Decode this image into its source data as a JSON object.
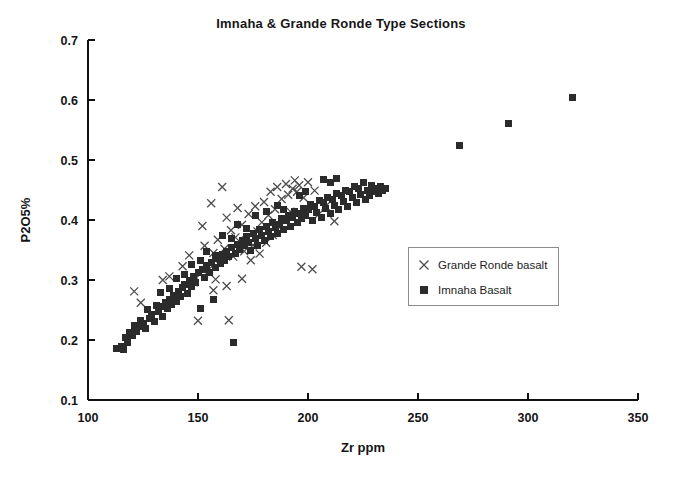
{
  "chart_data": {
    "type": "scatter",
    "title": "Imnaha & Grande Ronde Type Sections",
    "xlabel": "Zr ppm",
    "ylabel": "P2O5%",
    "xlim": [
      100,
      350
    ],
    "ylim": [
      0.1,
      0.7
    ],
    "xticks": [
      100,
      150,
      200,
      250,
      300,
      350
    ],
    "xtick_labels": [
      "100",
      "150",
      "200",
      "250",
      "300",
      "350"
    ],
    "yticks": [
      0.1,
      0.2,
      0.3,
      0.4,
      0.5,
      0.6,
      0.7
    ],
    "ytick_labels": [
      "0.1",
      "0.2",
      "0.3",
      "0.4",
      "0.5",
      "0.6",
      "0.7"
    ],
    "grid": false,
    "legend_position": "center-right",
    "series": [
      {
        "name": "Grande Ronde basalt",
        "marker": "x",
        "color": "#4a4a4a",
        "points": [
          [
            121,
            0.281
          ],
          [
            124,
            0.262
          ],
          [
            134,
            0.3
          ],
          [
            137,
            0.306
          ],
          [
            143,
            0.323
          ],
          [
            146,
            0.341
          ],
          [
            148,
            0.296
          ],
          [
            150,
            0.232
          ],
          [
            151,
            0.31
          ],
          [
            152,
            0.39
          ],
          [
            153,
            0.357
          ],
          [
            155,
            0.318
          ],
          [
            156,
            0.428
          ],
          [
            157,
            0.345
          ],
          [
            158,
            0.301
          ],
          [
            159,
            0.367
          ],
          [
            160,
            0.336
          ],
          [
            161,
            0.455
          ],
          [
            162,
            0.352
          ],
          [
            163,
            0.404
          ],
          [
            164,
            0.233
          ],
          [
            165,
            0.383
          ],
          [
            166,
            0.339
          ],
          [
            167,
            0.371
          ],
          [
            168,
            0.42
          ],
          [
            169,
            0.355
          ],
          [
            170,
            0.392
          ],
          [
            171,
            0.348
          ],
          [
            172,
            0.366
          ],
          [
            173,
            0.41
          ],
          [
            174,
            0.333
          ],
          [
            175,
            0.358
          ],
          [
            176,
            0.423
          ],
          [
            177,
            0.381
          ],
          [
            178,
            0.344
          ],
          [
            179,
            0.396
          ],
          [
            180,
            0.43
          ],
          [
            181,
            0.362
          ],
          [
            182,
            0.408
          ],
          [
            183,
            0.447
          ],
          [
            184,
            0.375
          ],
          [
            185,
            0.418
          ],
          [
            186,
            0.455
          ],
          [
            187,
            0.388
          ],
          [
            188,
            0.435
          ],
          [
            189,
            0.401
          ],
          [
            190,
            0.46
          ],
          [
            191,
            0.442
          ],
          [
            192,
            0.414
          ],
          [
            193,
            0.452
          ],
          [
            194,
            0.466
          ],
          [
            195,
            0.447
          ],
          [
            196,
            0.458
          ],
          [
            197,
            0.322
          ],
          [
            198,
            0.437
          ],
          [
            200,
            0.463
          ],
          [
            202,
            0.318
          ],
          [
            203,
            0.449
          ],
          [
            205,
            0.41
          ],
          [
            208,
            0.423
          ],
          [
            212,
            0.398
          ],
          [
            170,
            0.302
          ],
          [
            163,
            0.29
          ],
          [
            157,
            0.283
          ]
        ]
      },
      {
        "name": "Imnaha Basalt",
        "marker": "square",
        "color": "#2b2b2b",
        "points": [
          [
            113,
            0.186
          ],
          [
            115,
            0.19
          ],
          [
            116,
            0.185
          ],
          [
            118,
            0.196
          ],
          [
            120,
            0.207
          ],
          [
            122,
            0.215
          ],
          [
            123,
            0.222
          ],
          [
            125,
            0.228
          ],
          [
            126,
            0.219
          ],
          [
            128,
            0.236
          ],
          [
            129,
            0.243
          ],
          [
            130,
            0.231
          ],
          [
            132,
            0.248
          ],
          [
            133,
            0.256
          ],
          [
            134,
            0.24
          ],
          [
            135,
            0.262
          ],
          [
            136,
            0.253
          ],
          [
            137,
            0.268
          ],
          [
            138,
            0.259
          ],
          [
            139,
            0.274
          ],
          [
            140,
            0.265
          ],
          [
            141,
            0.281
          ],
          [
            142,
            0.272
          ],
          [
            143,
            0.287
          ],
          [
            144,
            0.293
          ],
          [
            145,
            0.278
          ],
          [
            146,
            0.3
          ],
          [
            147,
            0.289
          ],
          [
            148,
            0.306
          ],
          [
            149,
            0.296
          ],
          [
            150,
            0.312
          ],
          [
            151,
            0.252
          ],
          [
            152,
            0.318
          ],
          [
            153,
            0.305
          ],
          [
            154,
            0.324
          ],
          [
            155,
            0.313
          ],
          [
            156,
            0.33
          ],
          [
            157,
            0.268
          ],
          [
            158,
            0.321
          ],
          [
            159,
            0.336
          ],
          [
            160,
            0.327
          ],
          [
            161,
            0.342
          ],
          [
            162,
            0.333
          ],
          [
            163,
            0.348
          ],
          [
            164,
            0.339
          ],
          [
            165,
            0.354
          ],
          [
            166,
            0.196
          ],
          [
            167,
            0.345
          ],
          [
            168,
            0.36
          ],
          [
            169,
            0.351
          ],
          [
            170,
            0.366
          ],
          [
            171,
            0.357
          ],
          [
            172,
            0.372
          ],
          [
            173,
            0.363
          ],
          [
            174,
            0.35
          ],
          [
            175,
            0.378
          ],
          [
            176,
            0.369
          ],
          [
            177,
            0.358
          ],
          [
            178,
            0.384
          ],
          [
            179,
            0.375
          ],
          [
            180,
            0.366
          ],
          [
            181,
            0.39
          ],
          [
            182,
            0.381
          ],
          [
            183,
            0.372
          ],
          [
            184,
            0.396
          ],
          [
            185,
            0.387
          ],
          [
            186,
            0.378
          ],
          [
            187,
            0.393
          ],
          [
            188,
            0.402
          ],
          [
            189,
            0.384
          ],
          [
            190,
            0.399
          ],
          [
            191,
            0.408
          ],
          [
            192,
            0.39
          ],
          [
            193,
            0.405
          ],
          [
            194,
            0.414
          ],
          [
            195,
            0.396
          ],
          [
            196,
            0.411
          ],
          [
            197,
            0.402
          ],
          [
            198,
            0.42
          ],
          [
            199,
            0.408
          ],
          [
            200,
            0.417
          ],
          [
            201,
            0.426
          ],
          [
            202,
            0.399
          ],
          [
            203,
            0.423
          ],
          [
            204,
            0.413
          ],
          [
            205,
            0.432
          ],
          [
            206,
            0.405
          ],
          [
            207,
            0.429
          ],
          [
            208,
            0.419
          ],
          [
            209,
            0.438
          ],
          [
            210,
            0.411
          ],
          [
            211,
            0.435
          ],
          [
            212,
            0.425
          ],
          [
            213,
            0.444
          ],
          [
            214,
            0.417
          ],
          [
            215,
            0.441
          ],
          [
            216,
            0.431
          ],
          [
            217,
            0.45
          ],
          [
            218,
            0.423
          ],
          [
            219,
            0.447
          ],
          [
            220,
            0.437
          ],
          [
            221,
            0.456
          ],
          [
            222,
            0.429
          ],
          [
            223,
            0.453
          ],
          [
            224,
            0.443
          ],
          [
            225,
            0.462
          ],
          [
            226,
            0.435
          ],
          [
            227,
            0.449
          ],
          [
            228,
            0.441
          ],
          [
            229,
            0.458
          ],
          [
            230,
            0.447
          ],
          [
            231,
            0.452
          ],
          [
            232,
            0.444
          ],
          [
            233,
            0.456
          ],
          [
            234,
            0.449
          ],
          [
            235,
            0.453
          ],
          [
            207,
            0.468
          ],
          [
            210,
            0.462
          ],
          [
            213,
            0.47
          ],
          [
            196,
            0.441
          ],
          [
            199,
            0.447
          ],
          [
            186,
            0.424
          ],
          [
            189,
            0.418
          ],
          [
            176,
            0.408
          ],
          [
            181,
            0.414
          ],
          [
            168,
            0.392
          ],
          [
            172,
            0.386
          ],
          [
            161,
            0.375
          ],
          [
            165,
            0.369
          ],
          [
            154,
            0.347
          ],
          [
            158,
            0.341
          ],
          [
            147,
            0.326
          ],
          [
            151,
            0.333
          ],
          [
            140,
            0.303
          ],
          [
            144,
            0.31
          ],
          [
            133,
            0.279
          ],
          [
            137,
            0.286
          ],
          [
            127,
            0.251
          ],
          [
            131,
            0.258
          ],
          [
            121,
            0.225
          ],
          [
            124,
            0.233
          ],
          [
            117,
            0.205
          ],
          [
            119,
            0.212
          ],
          [
            269,
            0.524
          ],
          [
            291,
            0.561
          ],
          [
            320,
            0.604
          ]
        ]
      }
    ]
  }
}
